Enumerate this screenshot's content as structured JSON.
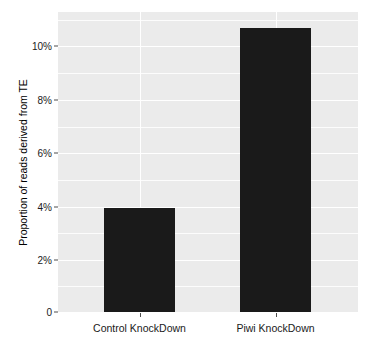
{
  "chart_data": {
    "type": "bar",
    "title": "",
    "subtitle": "",
    "xlabel": "",
    "ylabel": "Proportion of reads derived from TE",
    "categories": [
      "Control KnockDown",
      "Piwi KnockDown"
    ],
    "values": [
      3.9,
      10.7
    ],
    "value_unit": "%",
    "series": [
      {
        "name": "Proportion of reads derived from TE",
        "values": [
          3.9,
          10.7
        ],
        "color": "#1a1a1a"
      }
    ],
    "ylim": [
      0,
      11.3
    ],
    "y_ticks": [
      0,
      2,
      4,
      6,
      8,
      10
    ],
    "y_tick_labels": [
      "0",
      "2%",
      "4%",
      "6%",
      "8%",
      "10%"
    ],
    "y_minor_ticks": [
      1,
      3,
      5,
      7,
      9,
      11
    ],
    "grid": true,
    "grid_color": "#ffffff",
    "panel_background": "#ebebeb",
    "legend": false,
    "legend_position": "none",
    "annotations": []
  },
  "axes": {
    "y_title": "Proportion of reads derived from TE",
    "y_labels": [
      "10%",
      "8%",
      "6%",
      "4%",
      "2%",
      "0"
    ],
    "x_labels": [
      "Control KnockDown",
      "Piwi KnockDown"
    ]
  },
  "colors": {
    "bar_fill": "#1a1a1a",
    "panel": "#ebebeb",
    "grid": "#ffffff",
    "text": "#1a1a1a",
    "figure_background": "#ffffff"
  }
}
